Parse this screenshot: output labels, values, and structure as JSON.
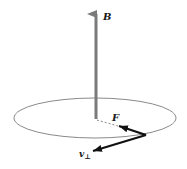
{
  "diagram": {
    "labels": {
      "magnetic_field": "B",
      "force": "F",
      "velocity_perp": "v",
      "velocity_perp_subscript": "⊥"
    },
    "colors": {
      "field_arrow": "#7a7a7a",
      "orbit": "#8a8a8a",
      "vector": "#111111",
      "dashed_radius": "#888888"
    }
  }
}
